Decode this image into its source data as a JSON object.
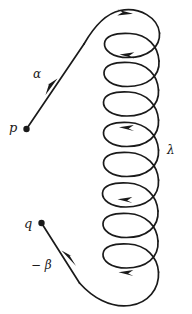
{
  "figure": {
    "background_color": "#ffffff",
    "stroke_color": "#1a1a1a",
    "stroke_width": 1.7,
    "width": 192,
    "height": 314
  },
  "labels": {
    "start_point": "p",
    "end_point": "q",
    "incoming_segment": "α",
    "outgoing_segment": "− β",
    "loop_segment": "λ"
  },
  "points": [
    {
      "name": "p",
      "label": "p",
      "x": 26,
      "y": 129,
      "marker": "filled-dot"
    },
    {
      "name": "q",
      "label": "q",
      "x": 41,
      "y": 223,
      "marker": "filled-dot"
    }
  ],
  "arrows": [
    {
      "name": "alpha-arrow",
      "x": 52,
      "y": 84,
      "direction": "up-right"
    },
    {
      "name": "top-arrow",
      "x": 124,
      "y": 12,
      "direction": "right"
    },
    {
      "name": "loop-arrow-1",
      "x": 127,
      "y": 54,
      "direction": "left"
    },
    {
      "name": "loop-arrow-2",
      "x": 127,
      "y": 127,
      "direction": "left"
    },
    {
      "name": "loop-arrow-3",
      "x": 125,
      "y": 199,
      "direction": "left"
    },
    {
      "name": "loop-arrow-4",
      "x": 126,
      "y": 272,
      "direction": "left"
    },
    {
      "name": "beta-arrow",
      "x": 68,
      "y": 258,
      "direction": "up-left"
    }
  ],
  "geometry": {
    "coil_left": 105,
    "coil_right": 160,
    "coil_top": 10,
    "coil_bottom": 306,
    "loop_count": 8,
    "loop_pitch": 36,
    "loop_rx": 28,
    "loop_ry": 13
  }
}
